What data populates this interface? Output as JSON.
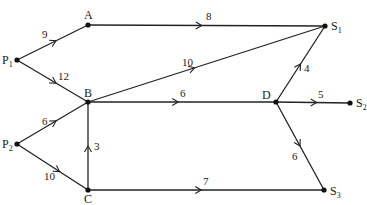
{
  "diagram": {
    "type": "directed-flow-network",
    "nodes": [
      {
        "id": "P1",
        "label": "P",
        "sub": "1",
        "x": 17,
        "y": 60,
        "lx": 2,
        "ly": 64
      },
      {
        "id": "A",
        "label": "A",
        "sub": "",
        "x": 88,
        "y": 25,
        "lx": 84,
        "ly": 19
      },
      {
        "id": "B",
        "label": "B",
        "sub": "",
        "x": 88,
        "y": 102,
        "lx": 84,
        "ly": 97
      },
      {
        "id": "P2",
        "label": "P",
        "sub": "2",
        "x": 17,
        "y": 144,
        "lx": 2,
        "ly": 148
      },
      {
        "id": "C",
        "label": "C",
        "sub": "",
        "x": 88,
        "y": 190,
        "lx": 84,
        "ly": 203
      },
      {
        "id": "S1",
        "label": "S",
        "sub": "1",
        "x": 325,
        "y": 26,
        "lx": 331,
        "ly": 30
      },
      {
        "id": "D",
        "label": "D",
        "sub": "",
        "x": 276,
        "y": 102,
        "lx": 262,
        "ly": 99
      },
      {
        "id": "S2",
        "label": "S",
        "sub": "2",
        "x": 350,
        "y": 103,
        "lx": 356,
        "ly": 107
      },
      {
        "id": "S3",
        "label": "S",
        "sub": "3",
        "x": 324,
        "y": 190,
        "lx": 330,
        "ly": 195
      }
    ],
    "edges": [
      {
        "from": "P1",
        "to": "A",
        "weight": "9",
        "t": 0.55,
        "lx": 42,
        "ly": 38
      },
      {
        "from": "P1",
        "to": "B",
        "weight": "12",
        "t": 0.55,
        "lx": 58,
        "ly": 80
      },
      {
        "from": "A",
        "to": "S1",
        "weight": "8",
        "t": 0.48,
        "lx": 206,
        "ly": 20
      },
      {
        "from": "B",
        "to": "S1",
        "weight": "10",
        "t": 0.45,
        "lx": 182,
        "ly": 66
      },
      {
        "from": "B",
        "to": "D",
        "weight": "6",
        "t": 0.48,
        "lx": 180,
        "ly": 97
      },
      {
        "from": "P2",
        "to": "B",
        "weight": "6",
        "t": 0.55,
        "lx": 42,
        "ly": 125
      },
      {
        "from": "P2",
        "to": "C",
        "weight": "10",
        "t": 0.6,
        "lx": 44,
        "ly": 180
      },
      {
        "from": "C",
        "to": "B",
        "weight": "3",
        "t": 0.5,
        "lx": 94,
        "ly": 150
      },
      {
        "from": "C",
        "to": "S3",
        "weight": "7",
        "t": 0.48,
        "lx": 203,
        "ly": 185
      },
      {
        "from": "D",
        "to": "S1",
        "weight": "4",
        "t": 0.5,
        "lx": 304,
        "ly": 72
      },
      {
        "from": "D",
        "to": "S2",
        "weight": "5",
        "t": 0.55,
        "lx": 318,
        "ly": 98
      },
      {
        "from": "D",
        "to": "S3",
        "weight": "6",
        "t": 0.5,
        "lx": 292,
        "ly": 160
      }
    ]
  }
}
